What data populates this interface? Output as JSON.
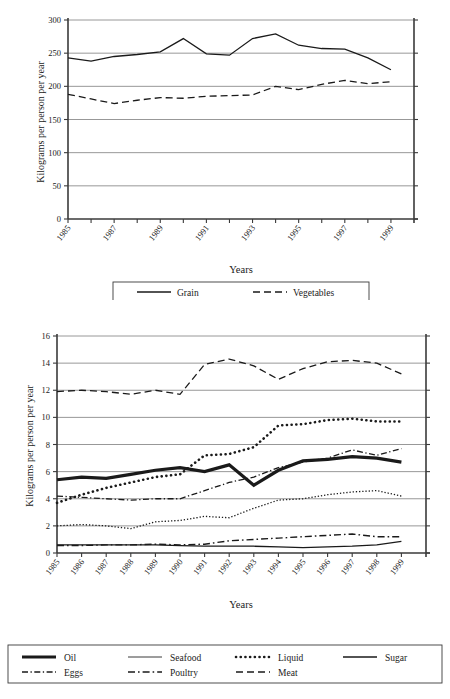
{
  "chart_data": [
    {
      "id": "top",
      "type": "line",
      "title": "",
      "xlabel": "Years",
      "ylabel": "Kilograms per person per year",
      "xlim": [
        1985,
        2000
      ],
      "ylim": [
        0,
        300
      ],
      "yticks": [
        0,
        50,
        100,
        150,
        200,
        250,
        300
      ],
      "xticks": [
        1985,
        1986,
        1987,
        1988,
        1989,
        1990,
        1991,
        1992,
        1993,
        1994,
        1995,
        1996,
        1997,
        1998,
        1999
      ],
      "xticklabels": [
        "1985",
        "",
        "1987",
        "",
        "1989",
        "",
        "1991",
        "",
        "1993",
        "",
        "1995",
        "",
        "1997",
        "",
        "1999"
      ],
      "grid": true,
      "legend_position": "below",
      "x": [
        1985,
        1986,
        1987,
        1988,
        1989,
        1990,
        1991,
        1992,
        1993,
        1994,
        1995,
        1996,
        1997,
        1998,
        1999
      ],
      "series": [
        {
          "name": "Grain",
          "style": "solid",
          "values": [
            243,
            238,
            245,
            248,
            252,
            272,
            249,
            247,
            272,
            279,
            262,
            257,
            256,
            243,
            225
          ]
        },
        {
          "name": "Vegetables",
          "style": "dashed",
          "values": [
            188,
            181,
            174,
            179,
            183,
            182,
            185,
            186,
            187,
            200,
            195,
            203,
            209,
            204,
            207
          ]
        }
      ]
    },
    {
      "id": "bottom",
      "type": "line",
      "title": "",
      "xlabel": "Years",
      "ylabel": "Kilograms per person per year",
      "xlim": [
        1985,
        2000
      ],
      "ylim": [
        0,
        16
      ],
      "yticks": [
        0,
        2,
        4,
        6,
        8,
        10,
        12,
        14,
        16
      ],
      "xticks": [
        1985,
        1986,
        1987,
        1988,
        1989,
        1990,
        1991,
        1992,
        1993,
        1994,
        1995,
        1996,
        1997,
        1998,
        1999
      ],
      "xticklabels": [
        "1985",
        "1986",
        "1987",
        "1988",
        "1989",
        "1990",
        "1991",
        "1992",
        "1993",
        "1994",
        "1995",
        "1996",
        "1997",
        "1998",
        "1999"
      ],
      "grid": true,
      "legend_position": "below",
      "x": [
        1985,
        1986,
        1987,
        1988,
        1989,
        1990,
        1991,
        1992,
        1993,
        1994,
        1995,
        1996,
        1997,
        1998,
        1999
      ],
      "series": [
        {
          "name": "Oil",
          "style": "thick-solid",
          "values": [
            5.4,
            5.6,
            5.5,
            5.8,
            6.1,
            6.3,
            6.0,
            6.5,
            5.0,
            6.1,
            6.8,
            6.9,
            7.1,
            7.0,
            6.7
          ]
        },
        {
          "name": "Seafood",
          "style": "fine-dotted",
          "values": [
            2.0,
            2.1,
            2.0,
            1.8,
            2.3,
            2.4,
            2.7,
            2.6,
            3.3,
            3.9,
            4.0,
            4.3,
            4.5,
            4.6,
            4.2
          ]
        },
        {
          "name": "Liquid",
          "style": "bold-dotted",
          "values": [
            3.7,
            4.3,
            4.8,
            5.2,
            5.6,
            5.8,
            7.2,
            7.3,
            7.8,
            9.4,
            9.5,
            9.8,
            9.9,
            9.7,
            9.7
          ]
        },
        {
          "name": "Sugar",
          "style": "solid",
          "values": [
            0.6,
            0.6,
            0.6,
            0.6,
            0.6,
            0.55,
            0.5,
            0.5,
            0.5,
            0.45,
            0.4,
            0.45,
            0.5,
            0.6,
            0.85
          ]
        },
        {
          "name": "Eggs",
          "style": "dash-dot-dash",
          "values": [
            4.2,
            4.1,
            4.0,
            3.9,
            4.0,
            4.0,
            4.6,
            5.2,
            5.6,
            6.3,
            6.7,
            7.0,
            7.6,
            7.2,
            7.7
          ]
        },
        {
          "name": "Poultry",
          "style": "dash-dot",
          "values": [
            0.55,
            0.55,
            0.6,
            0.6,
            0.65,
            0.6,
            0.65,
            0.9,
            1.0,
            1.1,
            1.2,
            1.3,
            1.4,
            1.2,
            1.2
          ]
        },
        {
          "name": "Meat",
          "style": "dashed",
          "values": [
            11.9,
            12.0,
            11.9,
            11.7,
            12.0,
            11.7,
            13.9,
            14.3,
            13.8,
            12.8,
            13.6,
            14.1,
            14.2,
            14.0,
            13.2
          ]
        }
      ]
    }
  ],
  "top_chart": {
    "ylabel": "Kilograms per person per year",
    "xlabel": "Years",
    "legend": [
      {
        "label": "Grain",
        "style": "solid"
      },
      {
        "label": "Vegetables",
        "style": "dashed"
      }
    ]
  },
  "bottom_chart": {
    "ylabel": "Kilograms per person per year",
    "xlabel": "Years",
    "legend": [
      {
        "label": "Oil",
        "style": "thick-solid"
      },
      {
        "label": "Seafood",
        "style": "light-solid"
      },
      {
        "label": "Liquid",
        "style": "bold-dotted"
      },
      {
        "label": "Sugar",
        "style": "solid"
      },
      {
        "label": "Eggs",
        "style": "dash-dot-dash"
      },
      {
        "label": "Poultry",
        "style": "dash-dot"
      },
      {
        "label": "Meat",
        "style": "dashed"
      }
    ]
  },
  "colors": {
    "ink": "#1a1a1a",
    "grid": "#8c8c8c",
    "axis": "#3a3a3a",
    "background": "#ffffff"
  }
}
